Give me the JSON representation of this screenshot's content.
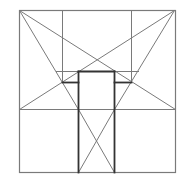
{
  "diagram": {
    "width": 183,
    "height": 180,
    "stroke_color": "#7a7a7a",
    "bold_stroke_color": "#333333",
    "outer_square": {
      "x1": 19,
      "y1": 10,
      "x2": 175,
      "y2": 172
    },
    "thin_lines": [
      {
        "id": "inner-vertical-left",
        "x1": 62,
        "y1": 10,
        "x2": 62,
        "y2": 82
      },
      {
        "id": "inner-vertical-right",
        "x1": 131,
        "y1": 10,
        "x2": 131,
        "y2": 82
      },
      {
        "id": "midline-horizontal",
        "x1": 19,
        "y1": 109,
        "x2": 175,
        "y2": 109
      },
      {
        "id": "upper-horizontal",
        "x1": 56,
        "y1": 71,
        "x2": 138,
        "y2": 71
      },
      {
        "id": "diag-tl-to-right-mid",
        "x1": 19,
        "y1": 10,
        "x2": 175,
        "y2": 109
      },
      {
        "id": "diag-tr-to-left-mid",
        "x1": 174,
        "y1": 10,
        "x2": 19,
        "y2": 109
      },
      {
        "id": "diag-tl-to-center-left",
        "x1": 19,
        "y1": 10,
        "x2": 78,
        "y2": 109
      },
      {
        "id": "diag-tr-to-center-right",
        "x1": 174,
        "y1": 10,
        "x2": 114,
        "y2": 109
      },
      {
        "id": "lower-x-1",
        "x1": 78,
        "y1": 109,
        "x2": 114,
        "y2": 172
      },
      {
        "id": "lower-x-2",
        "x1": 114,
        "y1": 109,
        "x2": 78,
        "y2": 172
      }
    ],
    "bold_lines": [
      {
        "id": "rect-left",
        "x1": 78,
        "y1": 71,
        "x2": 78,
        "y2": 172
      },
      {
        "id": "rect-right",
        "x1": 114,
        "y1": 71,
        "x2": 114,
        "y2": 172
      },
      {
        "id": "rect-top",
        "x1": 78,
        "y1": 71,
        "x2": 114,
        "y2": 71
      },
      {
        "id": "ledge-left",
        "x1": 62,
        "y1": 82,
        "x2": 78,
        "y2": 82
      },
      {
        "id": "ledge-right",
        "x1": 114,
        "y1": 82,
        "x2": 131,
        "y2": 82
      }
    ]
  }
}
